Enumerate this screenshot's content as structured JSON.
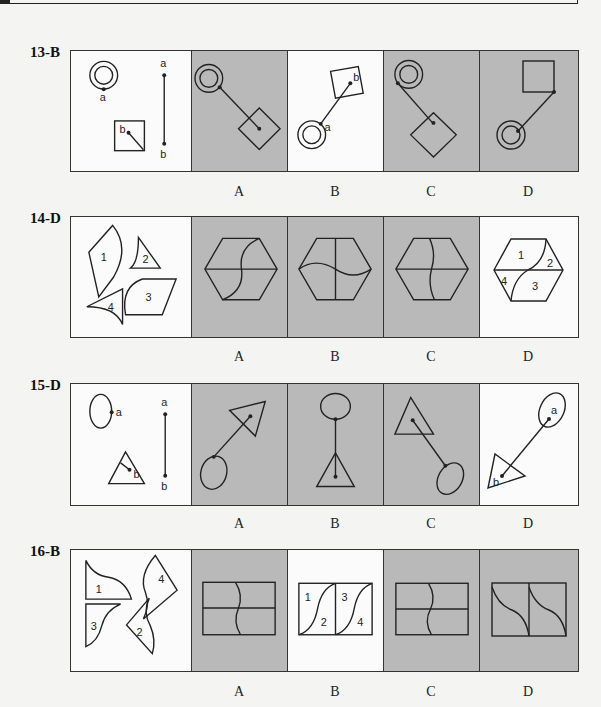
{
  "page": {
    "background": "#f4f4f2",
    "gray_panel": "#b9b9b9"
  },
  "questions": [
    {
      "label": "13-B",
      "answer": "B",
      "prompt_parts": {
        "circle_point": "a",
        "square_point": "b",
        "segment_top": "a",
        "segment_bottom": "b"
      },
      "options": [
        {
          "letter": "A",
          "shaded": true
        },
        {
          "letter": "B",
          "shaded": false,
          "point_labels": [
            "a",
            "b"
          ]
        },
        {
          "letter": "C",
          "shaded": true
        },
        {
          "letter": "D",
          "shaded": true
        }
      ]
    },
    {
      "label": "14-D",
      "answer": "D",
      "prompt_pieces": [
        "1",
        "2",
        "3",
        "4"
      ],
      "options": [
        {
          "letter": "A",
          "shaded": true
        },
        {
          "letter": "B",
          "shaded": true
        },
        {
          "letter": "C",
          "shaded": true
        },
        {
          "letter": "D",
          "shaded": false,
          "piece_labels": [
            "1",
            "2",
            "3",
            "4"
          ]
        }
      ]
    },
    {
      "label": "15-D",
      "answer": "D",
      "prompt_parts": {
        "ellipse_point": "a",
        "triangle_point": "b",
        "segment_top": "a",
        "segment_bottom": "b"
      },
      "options": [
        {
          "letter": "A",
          "shaded": true
        },
        {
          "letter": "B",
          "shaded": true
        },
        {
          "letter": "C",
          "shaded": true
        },
        {
          "letter": "D",
          "shaded": false,
          "point_labels": [
            "a",
            "b"
          ]
        }
      ]
    },
    {
      "label": "16-B",
      "answer": "B",
      "prompt_pieces": [
        "1",
        "2",
        "3",
        "4"
      ],
      "options": [
        {
          "letter": "A",
          "shaded": true
        },
        {
          "letter": "B",
          "shaded": false,
          "piece_labels": [
            "1",
            "2",
            "3",
            "4"
          ]
        },
        {
          "letter": "C",
          "shaded": true
        },
        {
          "letter": "D",
          "shaded": true
        }
      ]
    }
  ]
}
